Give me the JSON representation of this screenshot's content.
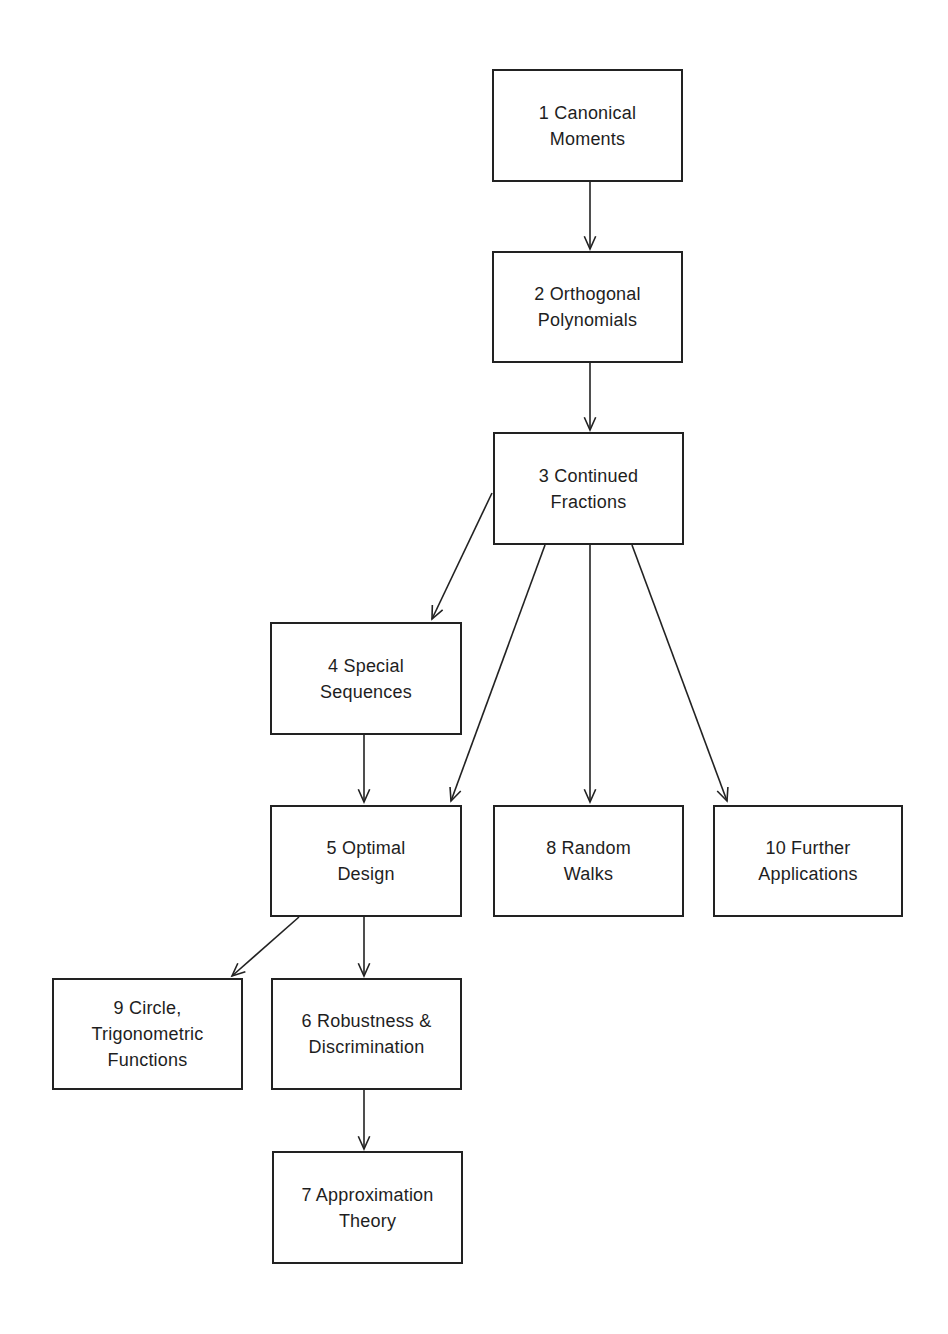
{
  "diagram": {
    "type": "chapter-dependency-flowchart",
    "colors": {
      "background": "#ffffff",
      "stroke": "#222222",
      "text": "#1e1e1e"
    },
    "nodes": [
      {
        "id": "n1",
        "number": "1",
        "label": "1   Canonical\nMoments",
        "x": 492,
        "y": 69,
        "w": 191,
        "h": 113
      },
      {
        "id": "n2",
        "number": "2",
        "label": "2   Orthogonal\nPolynomials",
        "x": 492,
        "y": 251,
        "w": 191,
        "h": 112
      },
      {
        "id": "n3",
        "number": "3",
        "label": "3   Continued\nFractions",
        "x": 493,
        "y": 432,
        "w": 191,
        "h": 113
      },
      {
        "id": "n4",
        "number": "4",
        "label": "4   Special\nSequences",
        "x": 270,
        "y": 622,
        "w": 192,
        "h": 113
      },
      {
        "id": "n5",
        "number": "5",
        "label": "5   Optimal\nDesign",
        "x": 270,
        "y": 805,
        "w": 192,
        "h": 112
      },
      {
        "id": "n8",
        "number": "8",
        "label": "8   Random\nWalks",
        "x": 493,
        "y": 805,
        "w": 191,
        "h": 112
      },
      {
        "id": "n10",
        "number": "10",
        "label": "10   Further\nApplications",
        "x": 713,
        "y": 805,
        "w": 190,
        "h": 112
      },
      {
        "id": "n9",
        "number": "9",
        "label": "9   Circle,\nTrigonometric\nFunctions",
        "x": 52,
        "y": 978,
        "w": 191,
        "h": 112
      },
      {
        "id": "n6",
        "number": "6",
        "label": "6   Robustness &\nDiscrimination",
        "x": 271,
        "y": 978,
        "w": 191,
        "h": 112
      },
      {
        "id": "n7",
        "number": "7",
        "label": "7   Approximation\nTheory",
        "x": 272,
        "y": 1151,
        "w": 191,
        "h": 113
      }
    ],
    "edges": [
      {
        "from": "n1",
        "to": "n2",
        "x1": 590,
        "y1": 182,
        "x2": 590,
        "y2": 249
      },
      {
        "from": "n2",
        "to": "n3",
        "x1": 590,
        "y1": 363,
        "x2": 590,
        "y2": 430
      },
      {
        "from": "n3",
        "to": "n4",
        "x1": 492,
        "y1": 493,
        "x2": 432,
        "y2": 619
      },
      {
        "from": "n3",
        "to": "n5",
        "x1": 545,
        "y1": 545,
        "x2": 451,
        "y2": 801
      },
      {
        "from": "n3",
        "to": "n8",
        "x1": 590,
        "y1": 545,
        "x2": 590,
        "y2": 802
      },
      {
        "from": "n3",
        "to": "n10",
        "x1": 632,
        "y1": 545,
        "x2": 727,
        "y2": 801
      },
      {
        "from": "n4",
        "to": "n5",
        "x1": 364,
        "y1": 735,
        "x2": 364,
        "y2": 802
      },
      {
        "from": "n5",
        "to": "n9",
        "x1": 299,
        "y1": 917,
        "x2": 232,
        "y2": 976
      },
      {
        "from": "n5",
        "to": "n6",
        "x1": 364,
        "y1": 917,
        "x2": 364,
        "y2": 976
      },
      {
        "from": "n6",
        "to": "n7",
        "x1": 364,
        "y1": 1090,
        "x2": 364,
        "y2": 1149
      }
    ]
  }
}
